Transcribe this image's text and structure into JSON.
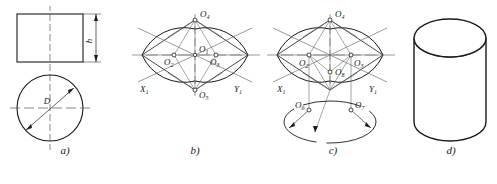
{
  "figure": {
    "panels": [
      {
        "id": "a",
        "caption": "a)",
        "description": "orthographic views: front rectangle and top circle",
        "labels": {
          "height": "h",
          "diameter": "D"
        },
        "dimensions": [
          {
            "name": "height",
            "text": "h",
            "orientation": "vertical"
          },
          {
            "name": "diameter",
            "text": "D",
            "orientation": "oblique"
          }
        ]
      },
      {
        "id": "b",
        "caption": "b)",
        "description": "isometric rhombus with four-centre ellipse for the top face",
        "axis_labels": {
          "x": "X",
          "x_sub": "1",
          "y": "Y",
          "y_sub": "1"
        },
        "centres": [
          {
            "name": "O",
            "sub": "1",
            "role": "centre of rhombus"
          },
          {
            "name": "O",
            "sub": "2",
            "role": "small-arc centre left"
          },
          {
            "name": "O",
            "sub": "3",
            "role": "small-arc centre right"
          },
          {
            "name": "O",
            "sub": "4",
            "role": "large-arc centre top"
          },
          {
            "name": "O",
            "sub": "5",
            "role": "large-arc centre bottom"
          }
        ]
      },
      {
        "id": "c",
        "caption": "c)",
        "description": "centres projected down by the height to draw the bottom ellipse",
        "axis_labels": {
          "x": "X",
          "x_sub": "1",
          "y": "Y",
          "y_sub": "1"
        },
        "centres": [
          {
            "name": "O",
            "sub": "2",
            "role": "small-arc centre left, top face"
          },
          {
            "name": "O",
            "sub": "3",
            "role": "small-arc centre right, top face"
          },
          {
            "name": "O",
            "sub": "4",
            "role": "large-arc centre top"
          },
          {
            "name": "O",
            "sub": "8",
            "role": "lowered large-arc centre"
          },
          {
            "name": "O",
            "sub": "6",
            "role": "small-arc centre left, bottom face"
          },
          {
            "name": "O",
            "sub": "7",
            "role": "small-arc centre right, bottom face"
          }
        ]
      },
      {
        "id": "d",
        "caption": "d)",
        "description": "finished isometric drawing of the cylinder",
        "labels": {}
      }
    ]
  },
  "style": {
    "line_color": "#1a1a1a",
    "construction_color": "#666666",
    "center_line_color": "#555555",
    "background": "#ffffff"
  }
}
